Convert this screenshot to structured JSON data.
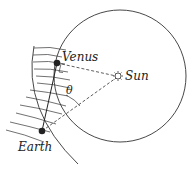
{
  "diagram": {
    "labels": {
      "venus": "Venus",
      "sun": "Sun",
      "earth": "Earth",
      "angle": "θ"
    },
    "colors": {
      "ink": "#222222",
      "background": "#ffffff"
    }
  }
}
